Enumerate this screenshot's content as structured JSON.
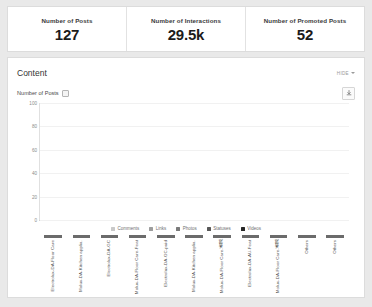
{
  "kpis": [
    {
      "label": "Number of Posts",
      "value": "127"
    },
    {
      "label": "Number of Interactions",
      "value": "29.5k"
    },
    {
      "label": "Number of Promoted Posts",
      "value": "52"
    }
  ],
  "content": {
    "title": "Content",
    "hide_label": "HIDE",
    "metric_label": "Number of Posts",
    "download_icon": "download-icon",
    "caret_icon": "chevron-down-icon"
  },
  "chart_data": {
    "type": "bar",
    "title": "Number of Posts",
    "xlabel": "",
    "ylabel": "",
    "ylim": [
      0,
      100
    ],
    "yticks": [
      "100",
      "80",
      "60",
      "40",
      "20",
      "0"
    ],
    "grid": true,
    "legend_position": "bottom",
    "stacked": true,
    "categories": [
      "Electrolux-DA-Floor Care",
      "Molux-DA-Kitchen applia.",
      "Electrolux-DA-GC",
      "Molux-DA-Floor Care-Feat",
      "Electrolux-DA-GC-paid",
      "Molux-DA-Kitchen applia.",
      "Molux-DA-Floor Care-香港",
      "Electrolux-DA-AU-Feat",
      "Molux-DA-Floor Care-香港",
      "Others",
      "Others"
    ],
    "series": [
      {
        "name": "Comments",
        "color": "#c9c9c9",
        "values": [
          0,
          0,
          0,
          0,
          0,
          0,
          0,
          0,
          0,
          0,
          0
        ]
      },
      {
        "name": "Links",
        "color": "#9d9d9d",
        "values": [
          5,
          2,
          0,
          0,
          0,
          0,
          0,
          0,
          0,
          0,
          0
        ]
      },
      {
        "name": "Photos",
        "color": "#7a7a7a",
        "values": [
          26,
          28,
          18,
          12,
          0,
          0,
          0,
          0,
          0,
          0,
          0
        ]
      },
      {
        "name": "Statuses",
        "color": "#575757",
        "values": [
          0,
          0,
          0,
          0,
          0,
          0,
          0,
          0,
          0,
          0,
          0
        ]
      },
      {
        "name": "Videos",
        "color": "#262626",
        "values": [
          62,
          31,
          13,
          21,
          17,
          12,
          3,
          2,
          2,
          1,
          6
        ]
      }
    ]
  }
}
